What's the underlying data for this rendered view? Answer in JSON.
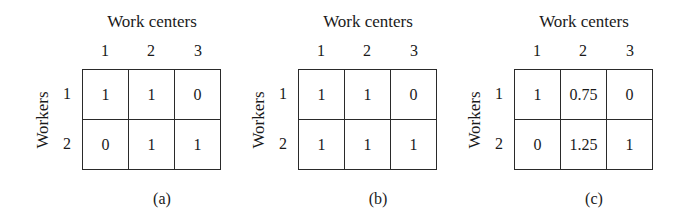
{
  "figure": {
    "panels": [
      {
        "id": "a",
        "caption": "(a)",
        "column_axis_title": "Work centers",
        "row_axis_title": "Workers",
        "column_labels": [
          "1",
          "2",
          "3"
        ],
        "row_labels": [
          "1",
          "2"
        ],
        "cells": [
          [
            "1",
            "1",
            "0"
          ],
          [
            "0",
            "1",
            "1"
          ]
        ]
      },
      {
        "id": "b",
        "caption": "(b)",
        "column_axis_title": "Work centers",
        "row_axis_title": "Workers",
        "column_labels": [
          "1",
          "2",
          "3"
        ],
        "row_labels": [
          "1",
          "2"
        ],
        "cells": [
          [
            "1",
            "1",
            "0"
          ],
          [
            "1",
            "1",
            "1"
          ]
        ]
      },
      {
        "id": "c",
        "caption": "(c)",
        "column_axis_title": "Work centers",
        "row_axis_title": "Workers",
        "column_labels": [
          "1",
          "2",
          "3"
        ],
        "row_labels": [
          "1",
          "2"
        ],
        "cells": [
          [
            "1",
            "0.75",
            "0"
          ],
          [
            "0",
            "1.25",
            "1"
          ]
        ]
      }
    ]
  }
}
